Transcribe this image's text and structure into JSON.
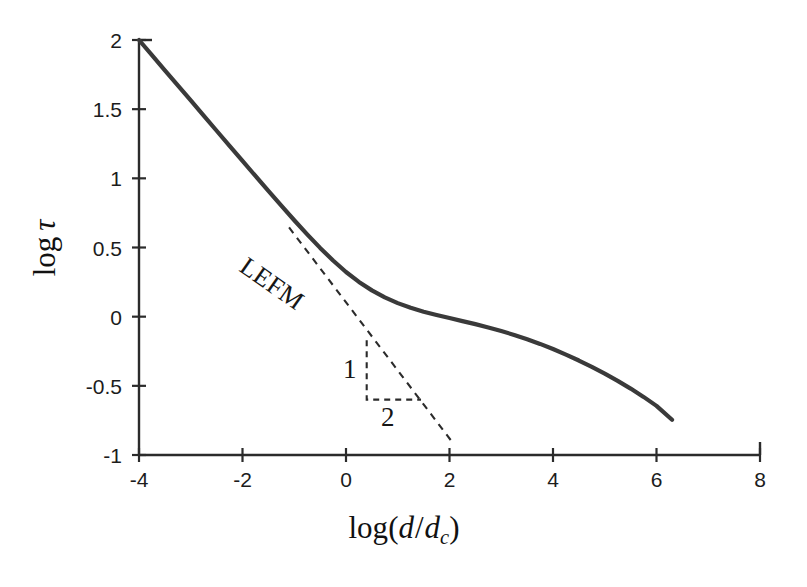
{
  "figure": {
    "background_color": "#ffffff",
    "curve_color": "#3a3a3a",
    "axis_color": "#2b2b2b",
    "dashed_color": "#2b2b2b"
  },
  "axes": {
    "x_title_parts": {
      "log": "log",
      "open_paren": "(",
      "d": "d",
      "slash": "/",
      "dc_base": "d",
      "dc_sub": "c",
      "close_paren": ")"
    },
    "y_title_parts": {
      "log": "log",
      "tau": "τ"
    },
    "x_ticks": [
      "-4",
      "-2",
      "0",
      "2",
      "4",
      "6",
      "8"
    ],
    "x_tick_values": [
      -4,
      -2,
      0,
      2,
      4,
      6,
      8
    ],
    "y_ticks": [
      "-1",
      "-0.5",
      "0",
      "0.5",
      "1",
      "1.5",
      "2"
    ],
    "y_tick_values": [
      -1,
      -0.5,
      0,
      0.5,
      1,
      1.5,
      2
    ],
    "xlim": [
      -4,
      8
    ],
    "ylim": [
      -1,
      2
    ]
  },
  "annotations": {
    "lefm": "LEFM",
    "slope_rise": "1",
    "slope_run": "2"
  },
  "chart_data": {
    "type": "line",
    "title": "",
    "subtitle": "",
    "xlabel": "log(d/dc)",
    "ylabel": "log τ",
    "xlim": [
      -4,
      8
    ],
    "ylim": [
      -1,
      2
    ],
    "x_ticks": [
      -4,
      -2,
      0,
      2,
      4,
      6,
      8
    ],
    "y_ticks": [
      -1,
      -0.5,
      0,
      0.5,
      1,
      1.5,
      2
    ],
    "grid": false,
    "legend": "none",
    "series": [
      {
        "name": "size effect law",
        "style": "solid",
        "color": "#3a3a3a",
        "x": [
          -4.0,
          -3.75,
          -3.5,
          -3.25,
          -3.0,
          -2.75,
          -2.5,
          -2.25,
          -2.0,
          -1.75,
          -1.5,
          -1.25,
          -1.0,
          -0.75,
          -0.5,
          -0.25,
          0.0,
          0.25,
          0.5,
          0.75,
          1.0,
          1.25,
          1.5,
          1.75,
          2.0,
          2.25,
          2.5,
          2.75,
          3.0,
          3.25,
          3.5,
          3.75,
          4.0,
          4.25,
          4.5,
          4.75,
          5.0,
          5.25,
          5.5,
          5.75,
          6.0,
          6.3
        ],
        "y": [
          2.0,
          1.891,
          1.781,
          1.672,
          1.563,
          1.453,
          1.344,
          1.235,
          1.126,
          1.017,
          0.909,
          0.802,
          0.697,
          0.595,
          0.497,
          0.406,
          0.323,
          0.251,
          0.19,
          0.139,
          0.098,
          0.064,
          0.036,
          0.012,
          -0.01,
          -0.032,
          -0.054,
          -0.078,
          -0.104,
          -0.132,
          -0.163,
          -0.197,
          -0.234,
          -0.274,
          -0.317,
          -0.363,
          -0.412,
          -0.464,
          -0.52,
          -0.58,
          -0.645,
          -0.745
        ]
      },
      {
        "name": "LEFM asymptote",
        "style": "dashed",
        "color": "#2b2b2b",
        "x": [
          -1.1,
          2.07
        ],
        "y": [
          0.645,
          -0.915
        ]
      }
    ],
    "slope_triangle": {
      "label_rise": "1",
      "label_run": "2",
      "vertex_x": 0.4,
      "vertex_y_top": -0.17,
      "vertex_y_bottom": -0.6,
      "vertex_x_right": 1.45
    },
    "annotations": [
      {
        "text": "LEFM",
        "x": -0.95,
        "y": 0.43,
        "rotation": -35
      },
      {
        "text": "1",
        "x": 0.15,
        "y": -0.35
      },
      {
        "text": "2",
        "x": 0.85,
        "y": -0.72
      }
    ]
  }
}
